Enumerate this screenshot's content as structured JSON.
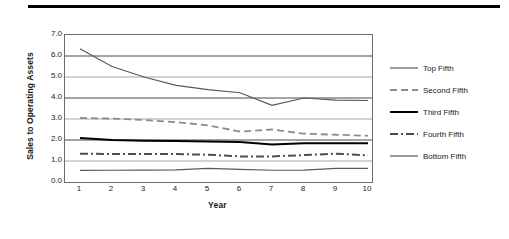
{
  "figure": {
    "top_rule": true
  },
  "chart_data": {
    "type": "line",
    "title": "",
    "xlabel": "Year",
    "ylabel": "Sales to Operating Assets",
    "x": [
      1,
      2,
      3,
      4,
      5,
      6,
      7,
      8,
      9,
      10
    ],
    "xtick_labels": [
      "1",
      "2",
      "3",
      "4",
      "5",
      "6",
      "7",
      "8",
      "9",
      "10"
    ],
    "ytick_labels": [
      "7.0",
      "6.0",
      "5.0",
      "4.0",
      "3.0",
      "2.0",
      "1.0",
      "0.0"
    ],
    "ytick_values": [
      7.0,
      6.0,
      5.0,
      4.0,
      3.0,
      2.0,
      1.0,
      0.0
    ],
    "ylim": [
      0.0,
      7.0
    ],
    "xlim": [
      1,
      10
    ],
    "grid": "horizontal",
    "legend_position": "right",
    "series": [
      {
        "name": "Top Fifth",
        "values": [
          6.35,
          5.5,
          5.0,
          4.6,
          4.4,
          4.25,
          3.65,
          4.0,
          3.9,
          3.88
        ],
        "color": "#595959",
        "style": "solid",
        "width": 1.2
      },
      {
        "name": "Second Fifth",
        "values": [
          3.05,
          3.02,
          2.95,
          2.85,
          2.7,
          2.4,
          2.5,
          2.3,
          2.25,
          2.2
        ],
        "color": "#8c8c8c",
        "style": "dashed",
        "width": 1.8
      },
      {
        "name": "Third Fifth",
        "values": [
          2.1,
          2.0,
          1.97,
          1.95,
          1.93,
          1.9,
          1.78,
          1.85,
          1.85,
          1.85
        ],
        "color": "#000000",
        "style": "solid",
        "width": 2.0
      },
      {
        "name": "Fourth Fifth",
        "values": [
          1.35,
          1.33,
          1.33,
          1.33,
          1.3,
          1.22,
          1.22,
          1.28,
          1.35,
          1.27
        ],
        "color": "#4d4d4d",
        "style": "dashdot",
        "width": 2.0
      },
      {
        "name": "Bottom Fifth",
        "values": [
          0.55,
          0.56,
          0.57,
          0.58,
          0.65,
          0.6,
          0.56,
          0.57,
          0.65,
          0.65
        ],
        "color": "#595959",
        "style": "solid",
        "width": 1.2
      }
    ]
  }
}
